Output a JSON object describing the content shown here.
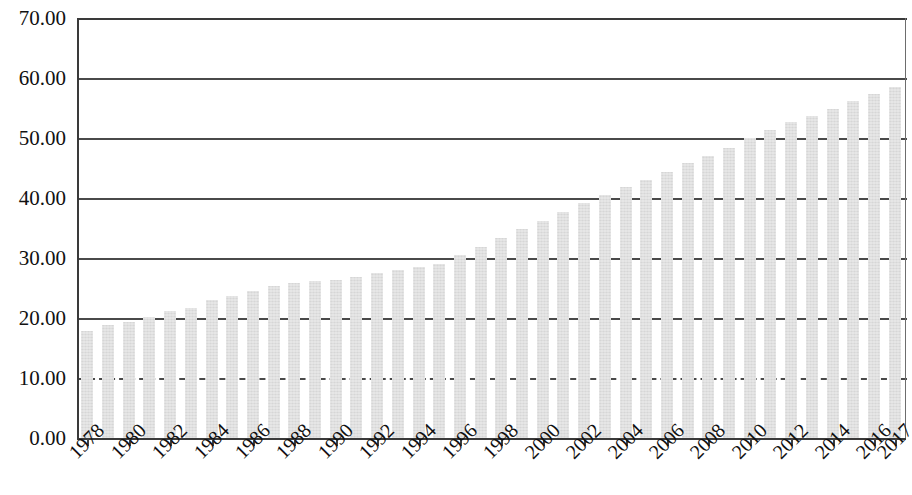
{
  "chart_data": {
    "type": "bar",
    "title": "",
    "subtitle": "",
    "xlabel": "",
    "ylabel": "",
    "ylim": [
      0,
      70
    ],
    "ytick_step": 10,
    "ytick_labels": [
      "0.00",
      "10.00",
      "20.00",
      "30.00",
      "40.00",
      "50.00",
      "60.00",
      "70.00"
    ],
    "ytick_values": [
      0,
      10,
      20,
      30,
      40,
      50,
      60,
      70
    ],
    "grid": "horizontal",
    "gridline_styles": [
      "solid",
      "dashed",
      "solid",
      "solid",
      "solid",
      "solid",
      "solid",
      "solid"
    ],
    "legend": null,
    "legend_position": "none",
    "bar_color": "#d6d6d6",
    "axis_color": "#3a3a3a",
    "x_tick_label_rotation": -45,
    "categories": [
      "1978",
      "1979",
      "1980",
      "1981",
      "1982",
      "1983",
      "1984",
      "1985",
      "1986",
      "1987",
      "1988",
      "1989",
      "1990",
      "1991",
      "1992",
      "1993",
      "1994",
      "1995",
      "1996",
      "1997",
      "1998",
      "1999",
      "2000",
      "2001",
      "2002",
      "2003",
      "2004",
      "2005",
      "2006",
      "2007",
      "2008",
      "2009",
      "2010",
      "2011",
      "2012",
      "2013",
      "2014",
      "2015",
      "2016",
      "2017"
    ],
    "displayed_xtick_labels": [
      "1978",
      "1980",
      "1982",
      "1984",
      "1986",
      "1988",
      "1990",
      "1992",
      "1994",
      "1996",
      "1998",
      "2000",
      "2002",
      "2004",
      "2006",
      "2008",
      "2010",
      "2012",
      "2014",
      "2016",
      "2017"
    ],
    "values": [
      17.9,
      18.9,
      19.4,
      20.2,
      21.1,
      21.6,
      23.0,
      23.7,
      24.5,
      25.3,
      25.8,
      26.2,
      26.4,
      26.9,
      27.5,
      28.0,
      28.5,
      29.0,
      30.5,
      31.9,
      33.4,
      34.8,
      36.2,
      37.7,
      39.1,
      40.5,
      41.8,
      43.0,
      44.3,
      45.9,
      47.0,
      48.3,
      50.0,
      51.3,
      52.6,
      53.7,
      54.8,
      56.1,
      57.4,
      58.5
    ]
  }
}
